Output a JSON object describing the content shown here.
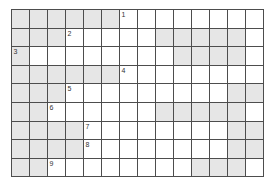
{
  "puzzle": {
    "type": "crossword-grid",
    "columns": 14,
    "rows": 9,
    "cell_width_px": 18,
    "cell_height_px": 18.6,
    "grid_origin": {
      "x": 11,
      "y": 9
    },
    "colors": {
      "background": "#ffffff",
      "cell_fill": "#ffffff",
      "shaded_fill": "#e6e6e6",
      "grid_line": "#4d4d4d",
      "number_text": "#333333"
    },
    "clue_numbers": [
      {
        "label": "1",
        "row": 1,
        "col": 7
      },
      {
        "label": "2",
        "row": 2,
        "col": 4
      },
      {
        "label": "3",
        "row": 3,
        "col": 1
      },
      {
        "label": "4",
        "row": 4,
        "col": 7
      },
      {
        "label": "5",
        "row": 5,
        "col": 4
      },
      {
        "label": "6",
        "row": 6,
        "col": 3
      },
      {
        "label": "7",
        "row": 7,
        "col": 5
      },
      {
        "label": "8",
        "row": 8,
        "col": 5
      },
      {
        "label": "9",
        "row": 9,
        "col": 3
      }
    ],
    "cells": [
      [
        {
          "shaded": true,
          "number": null
        },
        {
          "shaded": true,
          "number": null
        },
        {
          "shaded": true,
          "number": null
        },
        {
          "shaded": true,
          "number": null
        },
        {
          "shaded": true,
          "number": null
        },
        {
          "shaded": true,
          "number": null
        },
        {
          "shaded": false,
          "number": "1"
        },
        {
          "shaded": false,
          "number": null
        },
        {
          "shaded": false,
          "number": null
        },
        {
          "shaded": false,
          "number": null
        },
        {
          "shaded": false,
          "number": null
        },
        {
          "shaded": false,
          "number": null
        },
        {
          "shaded": false,
          "number": null
        },
        {
          "shaded": false,
          "number": null
        }
      ],
      [
        {
          "shaded": true,
          "number": null
        },
        {
          "shaded": true,
          "number": null
        },
        {
          "shaded": true,
          "number": null
        },
        {
          "shaded": false,
          "number": "2"
        },
        {
          "shaded": false,
          "number": null
        },
        {
          "shaded": false,
          "number": null
        },
        {
          "shaded": false,
          "number": null
        },
        {
          "shaded": false,
          "number": null
        },
        {
          "shaded": true,
          "number": null
        },
        {
          "shaded": true,
          "number": null
        },
        {
          "shaded": true,
          "number": null
        },
        {
          "shaded": true,
          "number": null
        },
        {
          "shaded": true,
          "number": null
        },
        {
          "shaded": false,
          "number": null
        }
      ],
      [
        {
          "shaded": true,
          "number": "3"
        },
        {
          "shaded": false,
          "number": null
        },
        {
          "shaded": false,
          "number": null
        },
        {
          "shaded": false,
          "number": null
        },
        {
          "shaded": false,
          "number": null
        },
        {
          "shaded": false,
          "number": null
        },
        {
          "shaded": false,
          "number": null
        },
        {
          "shaded": false,
          "number": null
        },
        {
          "shaded": false,
          "number": null
        },
        {
          "shaded": true,
          "number": null
        },
        {
          "shaded": true,
          "number": null
        },
        {
          "shaded": true,
          "number": null
        },
        {
          "shaded": true,
          "number": null
        },
        {
          "shaded": false,
          "number": null
        }
      ],
      [
        {
          "shaded": true,
          "number": null
        },
        {
          "shaded": true,
          "number": null
        },
        {
          "shaded": true,
          "number": null
        },
        {
          "shaded": true,
          "number": null
        },
        {
          "shaded": true,
          "number": null
        },
        {
          "shaded": true,
          "number": null
        },
        {
          "shaded": false,
          "number": "4"
        },
        {
          "shaded": false,
          "number": null
        },
        {
          "shaded": false,
          "number": null
        },
        {
          "shaded": false,
          "number": null
        },
        {
          "shaded": false,
          "number": null
        },
        {
          "shaded": false,
          "number": null
        },
        {
          "shaded": false,
          "number": null
        },
        {
          "shaded": false,
          "number": null
        }
      ],
      [
        {
          "shaded": true,
          "number": null
        },
        {
          "shaded": true,
          "number": null
        },
        {
          "shaded": true,
          "number": null
        },
        {
          "shaded": false,
          "number": "5"
        },
        {
          "shaded": false,
          "number": null
        },
        {
          "shaded": false,
          "number": null
        },
        {
          "shaded": false,
          "number": null
        },
        {
          "shaded": false,
          "number": null
        },
        {
          "shaded": false,
          "number": null
        },
        {
          "shaded": false,
          "number": null
        },
        {
          "shaded": false,
          "number": null
        },
        {
          "shaded": false,
          "number": null
        },
        {
          "shaded": true,
          "number": null
        },
        {
          "shaded": true,
          "number": null
        }
      ],
      [
        {
          "shaded": true,
          "number": null
        },
        {
          "shaded": true,
          "number": null
        },
        {
          "shaded": false,
          "number": "6"
        },
        {
          "shaded": false,
          "number": null
        },
        {
          "shaded": false,
          "number": null
        },
        {
          "shaded": false,
          "number": null
        },
        {
          "shaded": false,
          "number": null
        },
        {
          "shaded": false,
          "number": null
        },
        {
          "shaded": true,
          "number": null
        },
        {
          "shaded": true,
          "number": null
        },
        {
          "shaded": true,
          "number": null
        },
        {
          "shaded": true,
          "number": null
        },
        {
          "shaded": true,
          "number": null
        },
        {
          "shaded": false,
          "number": null
        }
      ],
      [
        {
          "shaded": true,
          "number": null
        },
        {
          "shaded": true,
          "number": null
        },
        {
          "shaded": true,
          "number": null
        },
        {
          "shaded": true,
          "number": null
        },
        {
          "shaded": false,
          "number": "7"
        },
        {
          "shaded": false,
          "number": null
        },
        {
          "shaded": false,
          "number": null
        },
        {
          "shaded": false,
          "number": null
        },
        {
          "shaded": false,
          "number": null
        },
        {
          "shaded": false,
          "number": null
        },
        {
          "shaded": false,
          "number": null
        },
        {
          "shaded": false,
          "number": null
        },
        {
          "shaded": true,
          "number": null
        },
        {
          "shaded": true,
          "number": null
        }
      ],
      [
        {
          "shaded": true,
          "number": null
        },
        {
          "shaded": true,
          "number": null
        },
        {
          "shaded": true,
          "number": null
        },
        {
          "shaded": true,
          "number": null
        },
        {
          "shaded": false,
          "number": "8"
        },
        {
          "shaded": false,
          "number": null
        },
        {
          "shaded": false,
          "number": null
        },
        {
          "shaded": false,
          "number": null
        },
        {
          "shaded": false,
          "number": null
        },
        {
          "shaded": false,
          "number": null
        },
        {
          "shaded": false,
          "number": null
        },
        {
          "shaded": false,
          "number": null
        },
        {
          "shaded": true,
          "number": null
        },
        {
          "shaded": true,
          "number": null
        }
      ],
      [
        {
          "shaded": true,
          "number": null
        },
        {
          "shaded": true,
          "number": null
        },
        {
          "shaded": false,
          "number": "9"
        },
        {
          "shaded": false,
          "number": null
        },
        {
          "shaded": false,
          "number": null
        },
        {
          "shaded": false,
          "number": null
        },
        {
          "shaded": false,
          "number": null
        },
        {
          "shaded": false,
          "number": null
        },
        {
          "shaded": false,
          "number": null
        },
        {
          "shaded": false,
          "number": null
        },
        {
          "shaded": true,
          "number": null
        },
        {
          "shaded": true,
          "number": null
        },
        {
          "shaded": true,
          "number": null
        },
        {
          "shaded": false,
          "number": null
        }
      ]
    ]
  }
}
